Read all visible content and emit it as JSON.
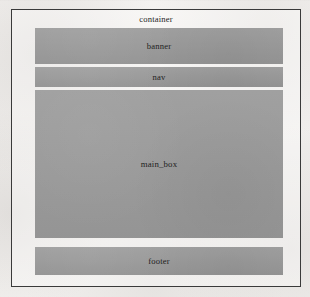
{
  "figure": {
    "type": "layout-box-diagram",
    "container": {
      "label": "container",
      "border_color": "#3a3a3a"
    },
    "block_color": "#9b9b9b",
    "page_background": "#f1efed",
    "text_color": "#1e1e1e",
    "blocks": [
      {
        "id": "banner",
        "label": "banner"
      },
      {
        "id": "nav",
        "label": "nav"
      },
      {
        "id": "main_box",
        "label": "main_box"
      },
      {
        "id": "footer",
        "label": "footer"
      }
    ]
  }
}
